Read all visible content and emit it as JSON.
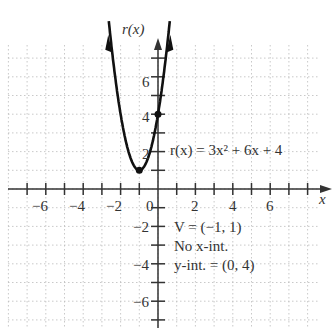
{
  "chart_data": {
    "type": "line",
    "title": "",
    "function_label": "r(x) = 3x² + 6x + 4",
    "xlabel": "x",
    "ylabel": "r(x)",
    "xlim": [
      -7.8,
      9.2
    ],
    "ylim": [
      -7.4,
      7.8
    ],
    "x_ticks": [
      -6,
      -4,
      -2,
      2,
      4,
      6
    ],
    "y_ticks": [
      -6,
      -4,
      -2,
      2,
      4,
      6
    ],
    "origin_label": "0",
    "grid": true,
    "series": [
      {
        "name": "r(x) = 3x^2 + 6x + 4",
        "x": [
          -2.63,
          -2,
          -1.5,
          -1,
          -0.5,
          0,
          0.63
        ],
        "y": [
          7.8,
          4,
          1.75,
          1,
          1.75,
          4,
          7.8
        ]
      }
    ],
    "points": [
      {
        "label": "vertex",
        "x": -1,
        "y": 1
      },
      {
        "label": "y-intercept",
        "x": 0,
        "y": 4
      }
    ],
    "annotations": [
      "V = (−1, 1)",
      "No x-int.",
      "y-int. = (0, 4)"
    ]
  },
  "labels": {
    "y_axis": "r(x)",
    "x_axis": "x",
    "function": "r(x) = 3x² + 6x + 4",
    "vertex": "V = (−1, 1)",
    "no_x_int": "No x-int.",
    "y_int": "y-int. = (0, 4)",
    "origin": "0",
    "x_ticks": [
      "−6",
      "−4",
      "−2",
      "2",
      "4",
      "6"
    ],
    "y_ticks": [
      "6",
      "4",
      "2",
      "−2",
      "−4",
      "−6"
    ]
  }
}
